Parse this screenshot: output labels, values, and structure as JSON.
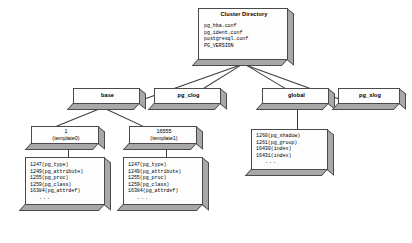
{
  "diagram": {
    "type": "tree",
    "root": {
      "title": "Cluster Directory",
      "files": [
        "pg_hba.conf",
        "pg_ident.conf",
        "postgresql.conf",
        "PG_VERSION"
      ]
    },
    "level2": [
      {
        "label": "base"
      },
      {
        "label": "pg_clog"
      },
      {
        "label": "global"
      },
      {
        "label": "pg_xlog"
      }
    ],
    "databases": [
      {
        "oid": "1",
        "name": "(template0)",
        "files": [
          "1247(pg_type)",
          "1249(pg_attribute)",
          "1255(pg_proc)",
          "1259(pg_class)",
          "16384(pg_attrdef)",
          "..."
        ]
      },
      {
        "oid": "16555",
        "name": "(template1)",
        "files": [
          "1247(pg_type)",
          "1249(pg_attribute)",
          "1255(pg_proc)",
          "1259(pg_class)",
          "16384(pg_attrdef)",
          "..."
        ]
      }
    ],
    "global_files": {
      "files": [
        "1260(pg_shadow)",
        "1261(pg_group)",
        "16430(index)",
        "16431(index)",
        "..."
      ]
    },
    "colors": {
      "box_face": "#fdfdfd",
      "box_shadow": "#a8a8a8",
      "box_border": "#4a4a4a",
      "line": "#3b3b3b",
      "text": "#000000"
    }
  }
}
